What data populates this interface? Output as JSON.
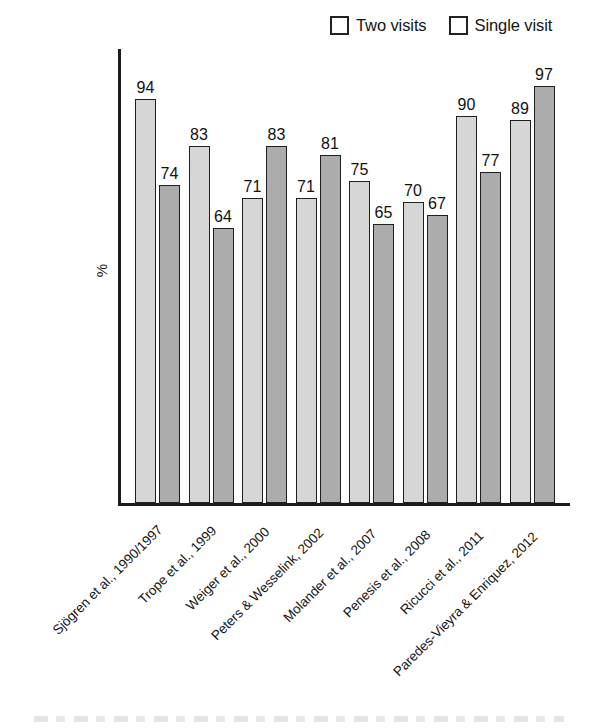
{
  "chart_data": {
    "type": "bar",
    "title": "",
    "xlabel": "",
    "ylabel": "%",
    "ylim": [
      0,
      100
    ],
    "grid": false,
    "legend_position": "top-right",
    "categories": [
      "Sjögren et al., 1990/1997",
      "Trope et al., 1999",
      "Weiger et al., 2000",
      "Peters & Wesselink, 2002",
      "Molander et al., 2007",
      "Penesis et al., 2008",
      "Ricucci et al., 2011",
      "Paredes-Vieyra & Enriquez, 2012"
    ],
    "series": [
      {
        "name": "Two visits",
        "color": "#d6d6d6",
        "values": [
          94,
          83,
          71,
          71,
          75,
          70,
          90,
          89
        ]
      },
      {
        "name": "Single visit",
        "color": "#acacac",
        "values": [
          74,
          64,
          83,
          81,
          65,
          67,
          77,
          97
        ]
      }
    ]
  },
  "legend": {
    "entries": [
      {
        "label": "Two visits",
        "color": "#d6d6d6"
      },
      {
        "label": "Single visit",
        "color": "#acacac"
      }
    ]
  },
  "axes": {
    "y_title": "%"
  }
}
